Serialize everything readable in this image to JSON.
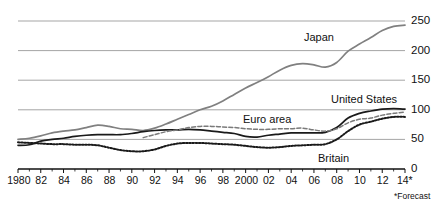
{
  "chart": {
    "footnote": "*Forecast",
    "axis": {
      "y_ticks": [
        "0",
        "50",
        "100",
        "150",
        "200",
        "250"
      ],
      "y_tick_values": [
        0,
        50,
        100,
        150,
        200,
        250
      ],
      "x_ticks": [
        "1980",
        "82",
        "84",
        "86",
        "88",
        "90",
        "92",
        "94",
        "96",
        "98",
        "2000",
        "02",
        "04",
        "06",
        "08",
        "10",
        "12",
        "14*"
      ],
      "x_tick_values": [
        1980,
        1982,
        1984,
        1986,
        1988,
        1990,
        1992,
        1994,
        1996,
        1998,
        2000,
        2002,
        2004,
        2006,
        2008,
        2010,
        2012,
        2014
      ]
    },
    "labels": {
      "japan": "Japan",
      "united_states": "United States",
      "euro_area": "Euro area",
      "britain": "Britain"
    },
    "colors": {
      "japan": "#808080",
      "united_states": "#1a1a1a",
      "euro_area": "#7a7a7a",
      "britain": "#1a1a1a",
      "gridline": "#9b9b9b",
      "axis": "#111111",
      "background": "#ffffff"
    }
  },
  "chart_data": {
    "type": "line",
    "title": "",
    "subtitle": "",
    "xlabel": "",
    "ylabel": "",
    "xlim": [
      1980,
      2014
    ],
    "ylim": [
      0,
      250
    ],
    "grid": true,
    "legend": "inline-labels",
    "note": "*Forecast",
    "x": [
      1980,
      1981,
      1982,
      1983,
      1984,
      1985,
      1986,
      1987,
      1988,
      1989,
      1990,
      1991,
      1992,
      1993,
      1994,
      1995,
      1996,
      1997,
      1998,
      1999,
      2000,
      2001,
      2002,
      2003,
      2004,
      2005,
      2006,
      2007,
      2008,
      2009,
      2010,
      2011,
      2012,
      2013,
      2014
    ],
    "series": [
      {
        "name": "Japan",
        "style": "solid",
        "color": "#808080",
        "values": [
          50,
          52,
          56,
          61,
          64,
          66,
          70,
          74,
          72,
          68,
          67,
          65,
          69,
          76,
          84,
          92,
          100,
          106,
          115,
          126,
          137,
          146,
          156,
          167,
          175,
          178,
          176,
          172,
          180,
          199,
          211,
          222,
          234,
          241,
          243
        ]
      },
      {
        "name": "United States",
        "style": "solid",
        "color": "#1a1a1a",
        "values": [
          40,
          41,
          47,
          50,
          52,
          55,
          57,
          58,
          58,
          58,
          60,
          63,
          65,
          66,
          66,
          67,
          66,
          64,
          62,
          60,
          55,
          54,
          57,
          59,
          61,
          61,
          61,
          62,
          70,
          86,
          94,
          98,
          101,
          102,
          101
        ]
      },
      {
        "name": "Euro area",
        "style": "dashed",
        "color": "#7a7a7a",
        "values": [
          null,
          null,
          null,
          null,
          null,
          null,
          null,
          null,
          null,
          null,
          null,
          53,
          58,
          63,
          66,
          70,
          72,
          72,
          71,
          70,
          68,
          67,
          67,
          68,
          68,
          69,
          66,
          64,
          68,
          78,
          84,
          86,
          91,
          94,
          96
        ]
      },
      {
        "name": "Britain",
        "style": "dotted",
        "color": "#1a1a1a",
        "values": [
          45,
          44,
          43,
          42,
          42,
          41,
          41,
          40,
          36,
          32,
          30,
          30,
          33,
          39,
          43,
          44,
          44,
          43,
          42,
          41,
          39,
          37,
          36,
          37,
          39,
          40,
          41,
          42,
          50,
          64,
          75,
          80,
          85,
          88,
          88
        ]
      }
    ]
  }
}
